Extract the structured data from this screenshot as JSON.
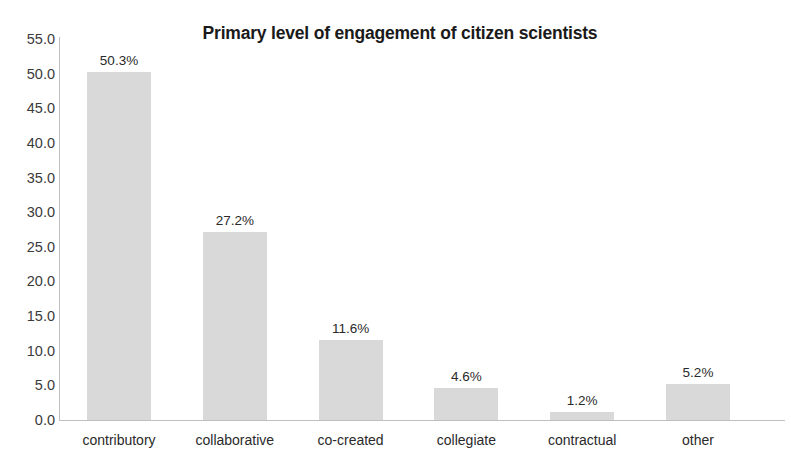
{
  "chart_data": {
    "type": "bar",
    "title": "Primary level of engagement of citizen scientists",
    "xlabel": "",
    "ylabel": "",
    "categories": [
      "contributory",
      "collaborative",
      "co-created",
      "collegiate",
      "contractual",
      "other"
    ],
    "values": [
      50.3,
      27.2,
      11.6,
      4.6,
      1.2,
      5.2
    ],
    "data_labels": [
      "50.3%",
      "27.2%",
      "11.6%",
      "4.6%",
      "1.2%",
      "5.2%"
    ],
    "ylim": [
      0.0,
      55.0
    ],
    "ytick_labels": [
      "55.0",
      "50.0",
      "45.0",
      "40.0",
      "35.0",
      "30.0",
      "25.0",
      "20.0",
      "15.0",
      "10.0",
      "5.0",
      "0.0"
    ],
    "ytick_values": [
      55.0,
      50.0,
      45.0,
      40.0,
      35.0,
      30.0,
      25.0,
      20.0,
      15.0,
      10.0,
      5.0,
      0.0
    ],
    "grid": false,
    "legend": false,
    "legend_position": "none",
    "bar_color": "#d9d9d9",
    "axis_color": "#bfbfbf",
    "title_color": "#1a1a1a",
    "tick_label_color": "#3b3b3b",
    "background_color": "#ffffff"
  }
}
